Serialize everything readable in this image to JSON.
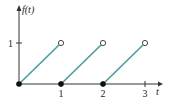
{
  "chart_data": {
    "type": "line",
    "title": "",
    "xlabel": "t",
    "ylabel": "f(t)",
    "xlim": [
      0,
      3.3
    ],
    "ylim": [
      0,
      1.4
    ],
    "x_ticks": [
      1,
      2,
      3
    ],
    "x_tick_labels": [
      "1",
      "2",
      "3"
    ],
    "y_ticks": [
      1
    ],
    "y_tick_labels": [
      "1"
    ],
    "grid": false,
    "series": [
      {
        "name": "segment-1",
        "x": [
          0,
          1
        ],
        "y": [
          0,
          1
        ],
        "start": "closed",
        "end": "open"
      },
      {
        "name": "segment-2",
        "x": [
          1,
          2
        ],
        "y": [
          0,
          1
        ],
        "start": "closed",
        "end": "open"
      },
      {
        "name": "segment-3",
        "x": [
          2,
          3
        ],
        "y": [
          0,
          1
        ],
        "start": "closed",
        "end": "open"
      }
    ],
    "colors": {
      "line": "#4a9a9e",
      "axis": "#333333",
      "point": "#111111"
    }
  }
}
